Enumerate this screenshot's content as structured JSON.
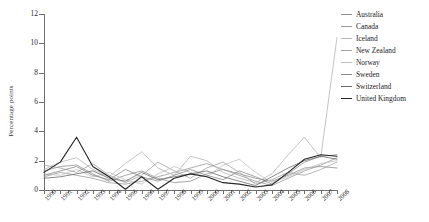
{
  "chart_data": {
    "type": "line",
    "title": "",
    "xlabel": "",
    "ylabel": "Percentage points",
    "x": [
      1990,
      1991,
      1992,
      1993,
      1994,
      1995,
      1996,
      1997,
      1998,
      1999,
      2000,
      2001,
      2002,
      2003,
      2004,
      2005,
      2006,
      2007,
      2008
    ],
    "xlim": [
      1990,
      2008
    ],
    "ylim": [
      0,
      12
    ],
    "yticks": [
      0,
      2,
      4,
      6,
      8,
      10,
      12
    ],
    "ytick_labels": [
      "0",
      "2",
      "4",
      "6",
      "8",
      "10",
      "12"
    ],
    "xtick_labels": [
      "1990",
      "1991",
      "1992",
      "1993",
      "1994",
      "1995",
      "1996",
      "1997",
      "1998",
      "1999",
      "2000",
      "2001",
      "2002",
      "2003",
      "2004",
      "2005",
      "2006",
      "2007",
      "2008"
    ],
    "grid": false,
    "legend_position": "right",
    "series": [
      {
        "name": "Australia",
        "color": "#8f8f8f",
        "values": [
          1.3,
          1.6,
          1.7,
          1.1,
          0.6,
          1.0,
          1.3,
          0.8,
          0.5,
          0.6,
          1.1,
          1.4,
          1.1,
          0.8,
          0.6,
          1.0,
          1.5,
          1.6,
          1.5
        ]
      },
      {
        "name": "Canada",
        "color": "#9a9a9a",
        "values": [
          0.9,
          1.2,
          1.0,
          0.8,
          0.5,
          0.4,
          0.6,
          0.9,
          1.2,
          1.5,
          1.8,
          1.4,
          1.0,
          0.6,
          0.3,
          0.8,
          1.3,
          1.7,
          2.2
        ]
      },
      {
        "name": "Iceland",
        "color": "#b5b5b5",
        "values": [
          1.4,
          1.9,
          2.2,
          1.4,
          0.9,
          1.8,
          2.6,
          1.5,
          1.0,
          2.3,
          2.0,
          1.2,
          0.8,
          0.5,
          1.1,
          2.4,
          3.6,
          2.2,
          10.4
        ]
      },
      {
        "name": "New Zealand",
        "color": "#a3a3a3",
        "values": [
          1.7,
          1.5,
          1.2,
          1.8,
          1.0,
          0.5,
          1.0,
          1.9,
          1.3,
          0.8,
          1.5,
          1.9,
          1.2,
          0.4,
          0.7,
          1.2,
          1.0,
          1.4,
          1.9
        ]
      },
      {
        "name": "Norway",
        "color": "#c0c0c0",
        "values": [
          1.1,
          1.0,
          1.4,
          0.9,
          1.2,
          0.7,
          0.4,
          1.1,
          1.6,
          1.2,
          0.9,
          1.7,
          2.1,
          1.2,
          0.5,
          0.9,
          1.4,
          1.8,
          2.0
        ]
      },
      {
        "name": "Sweden",
        "color": "#8a8a8a",
        "values": [
          1.0,
          1.3,
          1.6,
          1.0,
          0.7,
          1.4,
          0.9,
          0.6,
          1.0,
          1.4,
          1.0,
          0.7,
          1.3,
          0.9,
          0.4,
          1.1,
          1.9,
          2.3,
          2.4
        ]
      },
      {
        "name": "Switzerland",
        "color": "#6b6b6b",
        "values": [
          0.8,
          0.9,
          1.1,
          1.3,
          0.8,
          0.6,
          1.2,
          0.7,
          0.9,
          1.1,
          1.3,
          0.9,
          0.6,
          0.3,
          0.9,
          1.5,
          2.0,
          2.3,
          2.1
        ]
      },
      {
        "name": "United Kingdom",
        "color": "#262626",
        "values": [
          1.2,
          1.9,
          3.6,
          1.6,
          0.9,
          0.05,
          0.9,
          0.05,
          0.8,
          1.1,
          0.9,
          0.5,
          0.4,
          0.2,
          0.35,
          1.2,
          2.1,
          2.4,
          2.3
        ]
      }
    ]
  },
  "legend": {
    "entries": [
      {
        "label": "Australia"
      },
      {
        "label": "Canada"
      },
      {
        "label": "Iceland"
      },
      {
        "label": "New Zealand"
      },
      {
        "label": "Norway"
      },
      {
        "label": "Sweden"
      },
      {
        "label": "Switzerland"
      },
      {
        "label": "United Kingdom"
      }
    ]
  }
}
